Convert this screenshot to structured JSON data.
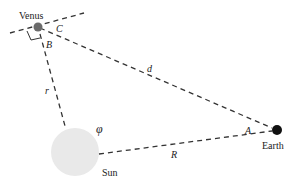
{
  "bodies": {
    "venus": {
      "label": "Venus",
      "x": 37,
      "y": 27,
      "color": "#6b6b6b"
    },
    "earth": {
      "label": "Earth",
      "x": 276,
      "y": 130,
      "color": "#111111"
    },
    "sun": {
      "label": "Sun",
      "x": 75,
      "y": 152,
      "color": "#e6e6e6"
    }
  },
  "distances": {
    "d": "d",
    "r": "r",
    "R": "R"
  },
  "angles": {
    "A": "A",
    "B": "B",
    "C": "C",
    "phi": "φ"
  },
  "colors": {
    "line": "#333333",
    "background": "#ffffff"
  }
}
